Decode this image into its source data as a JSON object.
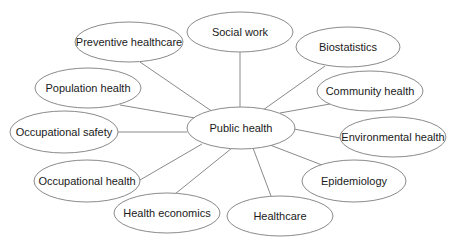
{
  "diagram": {
    "type": "mind-map",
    "center": {
      "id": "public-health",
      "label": "Public health",
      "cx": 241,
      "cy": 128,
      "rx": 54,
      "ry": 21
    },
    "nodes": [
      {
        "id": "preventive-healthcare",
        "label": "Preventive healthcare",
        "cx": 129,
        "cy": 42,
        "rx": 54,
        "ry": 20,
        "edge": [
          140,
          62,
          213,
          112
        ]
      },
      {
        "id": "social-work",
        "label": "Social work",
        "cx": 240,
        "cy": 32,
        "rx": 53,
        "ry": 20,
        "edge": [
          240,
          52,
          240,
          108
        ]
      },
      {
        "id": "biostatistics",
        "label": "Biostatistics",
        "cx": 348,
        "cy": 47,
        "rx": 52,
        "ry": 20,
        "edge": [
          325,
          66,
          263,
          110
        ]
      },
      {
        "id": "community-health",
        "label": "Community health",
        "cx": 370,
        "cy": 91,
        "rx": 53,
        "ry": 20,
        "edge": [
          330,
          104,
          280,
          113
        ]
      },
      {
        "id": "environmental-health",
        "label": "Environmental health",
        "cx": 393,
        "cy": 137,
        "rx": 53,
        "ry": 20,
        "edge": [
          294,
          129,
          340,
          138
        ]
      },
      {
        "id": "epidemiology",
        "label": "Epidemiology",
        "cx": 354,
        "cy": 181,
        "rx": 52,
        "ry": 21,
        "edge": [
          270,
          145,
          322,
          165
        ]
      },
      {
        "id": "healthcare",
        "label": "Healthcare",
        "cx": 280,
        "cy": 216,
        "rx": 53,
        "ry": 20,
        "edge": [
          253,
          148,
          271,
          196
        ]
      },
      {
        "id": "health-economics",
        "label": "Health economics",
        "cx": 167,
        "cy": 213,
        "rx": 53,
        "ry": 20,
        "edge": [
          232,
          148,
          175,
          194
        ]
      },
      {
        "id": "occupational-health",
        "label": "Occupational health",
        "cx": 87,
        "cy": 181,
        "rx": 53,
        "ry": 21,
        "edge": [
          202,
          144,
          140,
          180
        ]
      },
      {
        "id": "occupational-safety",
        "label": "Occupational safety",
        "cx": 64,
        "cy": 132,
        "rx": 54,
        "ry": 21,
        "edge": [
          118,
          132,
          187,
          132
        ]
      },
      {
        "id": "population-health",
        "label": "Population health",
        "cx": 88,
        "cy": 88,
        "rx": 53,
        "ry": 20,
        "edge": [
          120,
          105,
          195,
          118
        ]
      }
    ],
    "colors": {
      "stroke": "#8a8a8a",
      "fill": "#ffffff",
      "text": "#1a1a1a",
      "background": "#ffffff"
    }
  }
}
